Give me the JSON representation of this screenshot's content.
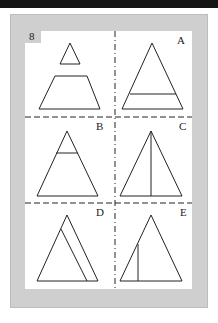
{
  "puzzle": {
    "number": "8",
    "question_figure": "small triangle above a trapezoid",
    "options": [
      {
        "label": "A",
        "figure": "triangle with horizontal line near base"
      },
      {
        "label": "B",
        "figure": "triangle with horizontal line near apex"
      },
      {
        "label": "C",
        "figure": "triangle with vertical line from apex to base"
      },
      {
        "label": "D",
        "figure": "triangle with inner line parallel to right side"
      },
      {
        "label": "E",
        "figure": "triangle with short vertical line on left"
      }
    ]
  },
  "colors": {
    "frame": "#cfcfcf",
    "panel": "#ffffff",
    "line": "#222222",
    "topbar": "#141414"
  }
}
